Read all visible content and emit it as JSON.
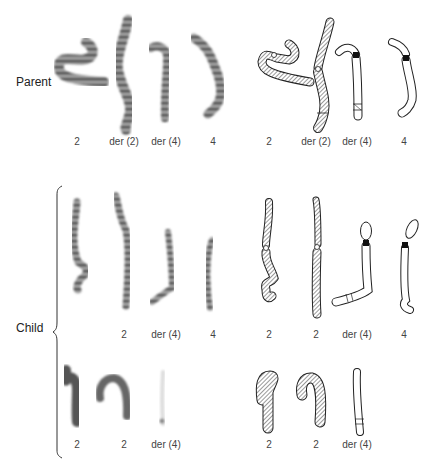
{
  "figure": {
    "row_labels": {
      "parent": "Parent",
      "child": "Child"
    },
    "parent": {
      "photo_labels": [
        "2",
        "der (2)",
        "der (4)",
        "4"
      ],
      "diagram_labels": [
        "2",
        "der (2)",
        "der (4)",
        "4"
      ]
    },
    "child_row1": {
      "photo_labels": [
        "2",
        "der (4)",
        "4"
      ],
      "diagram_labels": [
        "2",
        "2",
        "der (4)",
        "4"
      ]
    },
    "child_row2": {
      "photo_labels": [
        "2",
        "2",
        "der (4)"
      ],
      "diagram_labels": [
        "2",
        "2",
        "der (4)"
      ]
    },
    "colors": {
      "band_dark": "#3a3a3a",
      "band_light": "#9a9a9a",
      "outline": "#222222",
      "hatch": "#555555"
    }
  }
}
